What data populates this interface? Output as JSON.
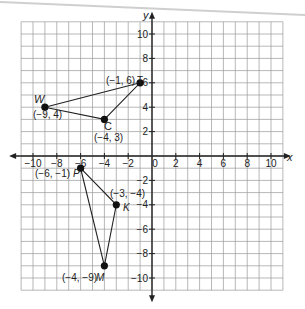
{
  "graph": {
    "x_axis_label": "x",
    "y_axis_label": "y",
    "x_range": [
      -11,
      11
    ],
    "y_range": [
      -11,
      11
    ],
    "x_tick_labels": [
      {
        "value": -10,
        "label": "−10"
      },
      {
        "value": -8,
        "label": "−8"
      },
      {
        "value": -6,
        "label": "−6"
      },
      {
        "value": -4,
        "label": "−4"
      },
      {
        "value": -2,
        "label": "−2"
      },
      {
        "value": 0,
        "label": "0"
      },
      {
        "value": 2,
        "label": "2"
      },
      {
        "value": 4,
        "label": "4"
      },
      {
        "value": 6,
        "label": "6"
      },
      {
        "value": 8,
        "label": "8"
      },
      {
        "value": 10,
        "label": "10"
      }
    ],
    "y_tick_labels": [
      {
        "value": 10,
        "label": "10"
      },
      {
        "value": 8,
        "label": "8"
      },
      {
        "value": 6,
        "label": "6"
      },
      {
        "value": 4,
        "label": "4"
      },
      {
        "value": 2,
        "label": "2"
      },
      {
        "value": -2,
        "label": "−2"
      },
      {
        "value": -4,
        "label": "−4"
      },
      {
        "value": -6,
        "label": "−6"
      },
      {
        "value": -8,
        "label": "−8"
      },
      {
        "value": -10,
        "label": "−10"
      }
    ],
    "colors": {
      "grid": "#9a9a9a",
      "axis": "#222222",
      "shape": "#222222",
      "point": "#111111"
    }
  },
  "triangles": [
    {
      "name": "triangle-TWC",
      "points": [
        {
          "name": "T",
          "x": -1,
          "y": 6,
          "coord_label": "(−1, 6)"
        },
        {
          "name": "W",
          "x": -9,
          "y": 4,
          "coord_label": "(−9, 4)"
        },
        {
          "name": "C",
          "x": -4,
          "y": 3,
          "coord_label": "(−4, 3)"
        }
      ]
    },
    {
      "name": "triangle-PKM",
      "points": [
        {
          "name": "P",
          "x": -6,
          "y": -1,
          "coord_label": "(−6, −1)"
        },
        {
          "name": "K",
          "x": -3,
          "y": -4,
          "coord_label": "(−3, −4)"
        },
        {
          "name": "M",
          "x": -4,
          "y": -9,
          "coord_label": "(−4, −9)"
        }
      ]
    }
  ],
  "labels": {
    "T_coord": "(−1, 6)",
    "T_name": "T",
    "W_coord": "(−9, 4)",
    "W_name": "W",
    "C_coord": "(−4, 3)",
    "C_name": "C",
    "P_coord": "(−6, −1)",
    "P_name": "P",
    "K_coord": "(−3, −4)",
    "K_name": "K",
    "M_coord": "(−4, −9)",
    "M_name": "M"
  }
}
